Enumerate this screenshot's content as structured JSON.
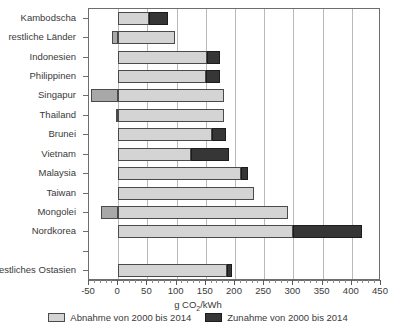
{
  "chart_data": {
    "type": "bar",
    "orientation": "horizontal",
    "stacked": true,
    "title": "",
    "xlabel": "g CO2/kWh",
    "xlabel_parts": {
      "pre": "g CO",
      "sub": "2",
      "post": "/kWh"
    },
    "ylabel": "",
    "xlim": [
      -50,
      450
    ],
    "xticks": [
      -50,
      0,
      50,
      100,
      150,
      200,
      250,
      300,
      350,
      400,
      450
    ],
    "xticklabels": [
      "-50",
      "0",
      "50",
      "100",
      "150",
      "200",
      "250",
      "300",
      "350",
      "400",
      "450"
    ],
    "minor_tick_step": 10,
    "grid": "vertical",
    "legend_position": "bottom",
    "categories": [
      "Kambodscha",
      "restliche Länder",
      "Indonesien",
      "Philippinen",
      "Singapur",
      "Thailand",
      "Brunei",
      "Vietnam",
      "Malaysia",
      "Taiwan",
      "Mongolei",
      "Nordkorea",
      "",
      "restliches Ostasien"
    ],
    "series": [
      {
        "name": "Abnahme von 2000 bis 2014",
        "color": "#d4d4d4",
        "negative_color": "#a8a8a8",
        "values": [
          53,
          97,
          152,
          150,
          182,
          182,
          160,
          125,
          210,
          233,
          290,
          300,
          0,
          186
        ],
        "negative_values": [
          0,
          -10,
          0,
          0,
          -47,
          -4,
          0,
          0,
          0,
          0,
          -30,
          0,
          0,
          0
        ]
      },
      {
        "name": "Zunahme von 2000 bis 2014",
        "color": "#363636",
        "values": [
          32,
          0,
          23,
          25,
          0,
          0,
          25,
          65,
          13,
          0,
          0,
          118,
          0,
          9
        ]
      }
    ],
    "legend": [
      {
        "label": "Abnahme von 2000 bis 2014",
        "color": "#d4d4d4"
      },
      {
        "label": "Zunahme von 2000 bis 2014",
        "color": "#363636"
      }
    ]
  }
}
